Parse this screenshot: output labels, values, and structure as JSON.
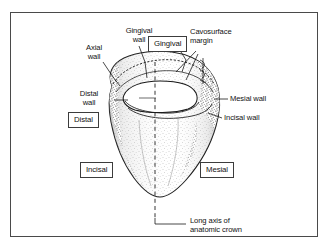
{
  "figure": {
    "background_color": "#ffffff",
    "frame_color": "#4a4a4a",
    "ink_color": "#121212"
  },
  "labels": {
    "gingival_wall": "Gingival\nwall",
    "axial_wall": "Axial\nwall",
    "cavosurface_margin": "Cavosurface\nmargin",
    "distal_wall": "Distal\nwall",
    "mesial_wall": "Mesial wall",
    "incisal_wall": "Incisal wall",
    "long_axis": "Long axis of\nanatomic crown"
  },
  "boxed_labels": {
    "gingival": "Gingival",
    "distal": "Distal",
    "incisal": "Incisal",
    "mesial": "Mesial"
  },
  "diagram_elements": {
    "crown_outline_name": "tooth-crown-outline",
    "cavity_outline_name": "cavity-preparation-outline",
    "long_axis_name": "long-axis-dashed-line"
  }
}
